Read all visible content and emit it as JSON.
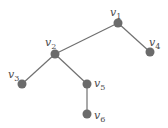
{
  "diagram": {
    "type": "tree",
    "colors": {
      "node": "#6b6b6b",
      "edge": "#707070",
      "label": "#4a4a4a"
    },
    "nodes": [
      {
        "id": "v1",
        "base": "v",
        "sub": "1"
      },
      {
        "id": "v2",
        "base": "v",
        "sub": "2"
      },
      {
        "id": "v3",
        "base": "v",
        "sub": "3"
      },
      {
        "id": "v4",
        "base": "v",
        "sub": "4"
      },
      {
        "id": "v5",
        "base": "v",
        "sub": "5"
      },
      {
        "id": "v6",
        "base": "v",
        "sub": "6"
      }
    ],
    "edges": [
      {
        "from": "v1",
        "to": "v2"
      },
      {
        "from": "v1",
        "to": "v4"
      },
      {
        "from": "v2",
        "to": "v3"
      },
      {
        "from": "v2",
        "to": "v5"
      },
      {
        "from": "v5",
        "to": "v6"
      }
    ]
  }
}
